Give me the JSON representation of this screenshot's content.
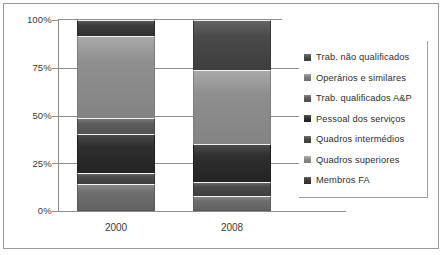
{
  "chart_data": {
    "type": "bar",
    "subtype": "stacked-percentage",
    "title": "",
    "xlabel": "",
    "ylabel": "",
    "categories": [
      "2000",
      "2008"
    ],
    "ylim": [
      0,
      100
    ],
    "ytick_labels": [
      "0%",
      "25%",
      "50%",
      "75%",
      "100%"
    ],
    "ytick_values": [
      0,
      25,
      50,
      75,
      100
    ],
    "grid": true,
    "legend_position": "right",
    "stack_order_bottom_to_top": [
      "Membros FA",
      "Quadros superiores",
      "Quadros intermédios",
      "Pessoal dos serviços",
      "Trab. qualificados A&P",
      "Operários e similares",
      "Trab. não qualificados"
    ],
    "series": [
      {
        "name": "Membros FA",
        "color": "#6e6e6e",
        "values": [
          14.5,
          8.0
        ]
      },
      {
        "name": "Quadros superiores",
        "color": "#8a8a8a",
        "values": [
          6.0,
          7.0
        ]
      },
      {
        "name": "Quadros intermédios",
        "color": "#4a4a4a",
        "values": [
          20.5,
          20.0
        ]
      },
      {
        "name": "Pessoal dos serviços",
        "color": "#2f2f2f",
        "values": [
          8.0,
          0.0
        ]
      },
      {
        "name": "Trab. qualificados A&P",
        "color": "#5d5d5d",
        "values": [
          43.0,
          39.0
        ]
      },
      {
        "name": "Operários e similares",
        "color": "#8f8f8f",
        "values": [
          0.0,
          0.0
        ]
      },
      {
        "name": "Trab. não qualificados",
        "color": "#3c3c3c",
        "values": [
          8.0,
          26.0
        ]
      }
    ]
  },
  "legend": {
    "items": [
      {
        "label": "Trab. não qualificados",
        "color": "#4a4a4a"
      },
      {
        "label": "Operários e similares",
        "color": "#7e7e7e"
      },
      {
        "label": "Trab. qualificados A&P",
        "color": "#5d5d5d"
      },
      {
        "label": "Pessoal dos serviços",
        "color": "#2f2f2f"
      },
      {
        "label": "Quadros intermédios",
        "color": "#4a4a4a"
      },
      {
        "label": "Quadros superiores",
        "color": "#8a8a8a"
      },
      {
        "label": "Membros FA",
        "color": "#3c3c3c"
      }
    ]
  },
  "axis": {
    "labels_y": [
      "100%",
      "75%",
      "50%",
      "25%",
      "0%"
    ]
  },
  "bars": {
    "b2000": {
      "label": "2000",
      "segments": [
        {
          "name": "Trab. não qualificados",
          "top_pct": 100.0,
          "bottom_pct": 91.5,
          "color": "#3c3c3c"
        },
        {
          "name": "Operários e similares",
          "top_pct": 91.5,
          "bottom_pct": 48.5,
          "color": "#8f8f8f"
        },
        {
          "name": "Trab. qualificados A&P",
          "top_pct": 48.5,
          "bottom_pct": 40.5,
          "color": "#5d5d5d"
        },
        {
          "name": "Pessoal dos serviços",
          "top_pct": 40.5,
          "bottom_pct": 20.0,
          "color": "#2f2f2f"
        },
        {
          "name": "Quadros intermédios",
          "top_pct": 20.0,
          "bottom_pct": 14.0,
          "color": "#4a4a4a"
        },
        {
          "name": "Quadros superiores",
          "top_pct": 14.0,
          "bottom_pct": 0.0,
          "color": "#6e6e6e"
        }
      ]
    },
    "b2008": {
      "label": "2008",
      "segments": [
        {
          "name": "Trab. não qualificados",
          "top_pct": 100.0,
          "bottom_pct": 74.0,
          "color": "#4a4a4a"
        },
        {
          "name": "Operários e similares",
          "top_pct": 74.0,
          "bottom_pct": 35.0,
          "color": "#8f8f8f"
        },
        {
          "name": "Trab. qualificados A&P",
          "top_pct": 35.0,
          "bottom_pct": 15.0,
          "color": "#2f2f2f"
        },
        {
          "name": "Quadros intermédios",
          "top_pct": 15.0,
          "bottom_pct": 8.0,
          "color": "#4a4a4a"
        },
        {
          "name": "Membros FA",
          "top_pct": 8.0,
          "bottom_pct": 0.0,
          "color": "#6e6e6e"
        }
      ]
    }
  }
}
